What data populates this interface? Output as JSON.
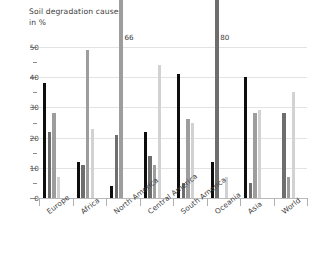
{
  "title": {
    "line1": "Soil degradation causes",
    "line2": "in %"
  },
  "chart_data": {
    "type": "bar",
    "title": "Soil degradation causes",
    "subtitle": "in %",
    "xlabel": "",
    "ylabel": "in %",
    "ylim": [
      0,
      50
    ],
    "yticks": [
      0,
      10,
      20,
      30,
      40,
      50
    ],
    "grid": true,
    "legend": "none",
    "categories": [
      "Europe",
      "Africa",
      "North America",
      "Central America",
      "South America",
      "Oceania",
      "Asia",
      "World"
    ],
    "series": [
      {
        "name": "series-1",
        "color": "#0d0d0d",
        "values": [
          38,
          12,
          4,
          22,
          41,
          12,
          40,
          0
        ]
      },
      {
        "name": "series-2",
        "color": "#6e6e6e",
        "values": [
          22,
          11,
          21,
          14,
          5,
          80,
          5,
          28
        ]
      },
      {
        "name": "series-3",
        "color": "#9d9d9d",
        "values": [
          28,
          49,
          66,
          11,
          26,
          0,
          28,
          7
        ]
      },
      {
        "name": "series-4",
        "color": "#d2d2d2",
        "values": [
          7,
          23,
          0,
          44,
          25,
          7,
          29,
          35
        ]
      }
    ],
    "annotations": [
      {
        "text": "66",
        "value": 66,
        "category": "North America",
        "series": "series-3"
      },
      {
        "text": "80",
        "value": 80,
        "category": "Oceania",
        "series": "series-2"
      }
    ]
  }
}
